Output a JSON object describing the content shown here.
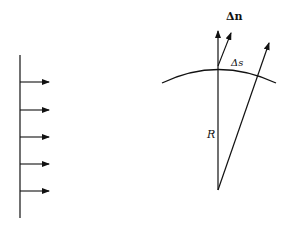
{
  "diagram": {
    "left_panel": {
      "description": "plane wavefront with parallel rays",
      "arrow_count": 5
    },
    "right_panel": {
      "description": "curved wavefront with radius and normals",
      "labels": {
        "delta_n": "Δn",
        "delta_s": "Δs",
        "radius": "R"
      }
    },
    "colors": {
      "stroke": "#111111",
      "background": "#ffffff"
    }
  }
}
